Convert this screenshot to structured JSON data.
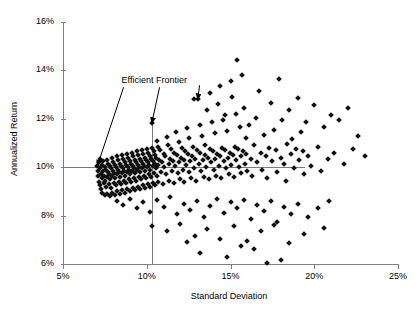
{
  "chart_data": {
    "type": "scatter",
    "title": "",
    "xlabel": "Standard Deviation",
    "ylabel": "Annualized Return",
    "xlim": [
      5,
      25
    ],
    "ylim": [
      6,
      16
    ],
    "xticks": [
      "5%",
      "10%",
      "15%",
      "20%",
      "25%"
    ],
    "xtick_values": [
      5,
      10,
      15,
      20,
      25
    ],
    "yticks": [
      "6%",
      "8%",
      "10%",
      "12%",
      "14%",
      "16%"
    ],
    "ytick_values": [
      6,
      8,
      10,
      12,
      14,
      16
    ],
    "grid": false,
    "legend": "none",
    "marker": "diamond",
    "marker_color": "#111111",
    "annotations": [
      {
        "text": "Efficient Frontier",
        "x_pct": 7.9,
        "y_pct": 13.55,
        "arrows": [
          {
            "to_x": 7.05,
            "to_y": 10.05
          },
          {
            "to_x": 10.3,
            "to_y": 11.82
          },
          {
            "to_x": 13.05,
            "to_y": 12.8
          }
        ]
      }
    ],
    "reference_lines": [
      {
        "orient": "horizontal",
        "value": 10.0,
        "from": 5.0,
        "to": 19.45,
        "color": "#7a7a7a"
      },
      {
        "orient": "vertical",
        "value": 10.3,
        "from": 6.0,
        "to": 11.82,
        "color": "#7a7a7a"
      }
    ],
    "points": [
      [
        7.05,
        10.05
      ],
      [
        7.08,
        9.85
      ],
      [
        7.1,
        9.62
      ],
      [
        7.12,
        10.2
      ],
      [
        7.15,
        9.4
      ],
      [
        7.18,
        9.95
      ],
      [
        7.2,
        9.25
      ],
      [
        7.22,
        10.35
      ],
      [
        7.25,
        9.7
      ],
      [
        7.28,
        9.1
      ],
      [
        7.3,
        10.1
      ],
      [
        7.32,
        9.55
      ],
      [
        7.35,
        8.95
      ],
      [
        7.38,
        9.85
      ],
      [
        7.4,
        10.25
      ],
      [
        7.42,
        9.35
      ],
      [
        7.45,
        9.65
      ],
      [
        7.48,
        8.85
      ],
      [
        7.5,
        10.0
      ],
      [
        7.52,
        9.45
      ],
      [
        7.55,
        9.9
      ],
      [
        7.58,
        9.2
      ],
      [
        7.6,
        10.3
      ],
      [
        7.62,
        9.6
      ],
      [
        7.65,
        8.9
      ],
      [
        7.68,
        9.8
      ],
      [
        7.7,
        10.15
      ],
      [
        7.72,
        9.3
      ],
      [
        7.75,
        9.7
      ],
      [
        7.78,
        8.8
      ],
      [
        7.8,
        10.05
      ],
      [
        7.82,
        9.5
      ],
      [
        7.85,
        9.95
      ],
      [
        7.88,
        9.15
      ],
      [
        7.9,
        10.4
      ],
      [
        7.92,
        9.65
      ],
      [
        7.95,
        8.95
      ],
      [
        7.98,
        9.85
      ],
      [
        8.0,
        10.2
      ],
      [
        8.02,
        9.35
      ],
      [
        8.05,
        9.75
      ],
      [
        8.08,
        8.85
      ],
      [
        8.1,
        10.1
      ],
      [
        8.12,
        9.55
      ],
      [
        8.15,
        10.0
      ],
      [
        8.18,
        9.25
      ],
      [
        8.2,
        10.45
      ],
      [
        8.22,
        9.7
      ],
      [
        8.25,
        9.0
      ],
      [
        8.28,
        9.9
      ],
      [
        8.3,
        10.3
      ],
      [
        8.32,
        9.4
      ],
      [
        8.35,
        9.8
      ],
      [
        8.38,
        8.9
      ],
      [
        8.4,
        10.15
      ],
      [
        8.42,
        9.6
      ],
      [
        8.45,
        10.05
      ],
      [
        8.48,
        9.3
      ],
      [
        8.5,
        10.5
      ],
      [
        8.52,
        9.75
      ],
      [
        8.55,
        9.05
      ],
      [
        8.58,
        9.95
      ],
      [
        8.6,
        10.35
      ],
      [
        8.62,
        9.45
      ],
      [
        8.65,
        9.85
      ],
      [
        8.68,
        8.95
      ],
      [
        8.7,
        10.2
      ],
      [
        8.72,
        9.65
      ],
      [
        8.75,
        10.1
      ],
      [
        8.78,
        9.35
      ],
      [
        8.8,
        10.55
      ],
      [
        8.82,
        9.8
      ],
      [
        8.85,
        9.1
      ],
      [
        8.88,
        10.0
      ],
      [
        8.9,
        10.4
      ],
      [
        8.92,
        9.5
      ],
      [
        8.95,
        9.9
      ],
      [
        8.98,
        9.0
      ],
      [
        9.0,
        10.25
      ],
      [
        9.02,
        9.7
      ],
      [
        9.05,
        10.15
      ],
      [
        9.08,
        9.4
      ],
      [
        9.1,
        10.6
      ],
      [
        9.12,
        9.85
      ],
      [
        9.15,
        9.15
      ],
      [
        9.18,
        10.05
      ],
      [
        9.2,
        10.45
      ],
      [
        9.22,
        9.55
      ],
      [
        9.25,
        9.95
      ],
      [
        9.28,
        9.05
      ],
      [
        9.3,
        10.3
      ],
      [
        9.32,
        9.75
      ],
      [
        9.35,
        10.2
      ],
      [
        9.38,
        9.45
      ],
      [
        9.4,
        10.65
      ],
      [
        9.42,
        9.9
      ],
      [
        9.45,
        9.2
      ],
      [
        9.48,
        10.1
      ],
      [
        9.5,
        10.5
      ],
      [
        9.52,
        9.6
      ],
      [
        9.55,
        10.0
      ],
      [
        9.58,
        9.1
      ],
      [
        9.6,
        10.35
      ],
      [
        9.62,
        9.8
      ],
      [
        9.65,
        10.25
      ],
      [
        9.68,
        9.5
      ],
      [
        9.7,
        10.7
      ],
      [
        9.72,
        9.95
      ],
      [
        9.75,
        9.25
      ],
      [
        9.78,
        10.15
      ],
      [
        9.8,
        10.55
      ],
      [
        9.82,
        9.65
      ],
      [
        9.85,
        10.05
      ],
      [
        9.88,
        9.15
      ],
      [
        9.9,
        10.4
      ],
      [
        9.92,
        9.85
      ],
      [
        9.95,
        10.3
      ],
      [
        9.98,
        9.55
      ],
      [
        10.0,
        10.75
      ],
      [
        10.02,
        10.0
      ],
      [
        10.05,
        9.3
      ],
      [
        10.08,
        10.2
      ],
      [
        10.1,
        10.6
      ],
      [
        10.12,
        9.7
      ],
      [
        10.15,
        10.1
      ],
      [
        10.18,
        9.2
      ],
      [
        10.2,
        10.45
      ],
      [
        10.22,
        9.9
      ],
      [
        10.25,
        10.35
      ],
      [
        10.28,
        9.6
      ],
      [
        10.3,
        11.82
      ],
      [
        10.32,
        10.8
      ],
      [
        10.35,
        10.05
      ],
      [
        10.38,
        9.35
      ],
      [
        10.4,
        10.25
      ],
      [
        10.42,
        10.65
      ],
      [
        10.45,
        9.75
      ],
      [
        10.48,
        10.15
      ],
      [
        10.5,
        9.25
      ],
      [
        10.52,
        10.5
      ],
      [
        10.55,
        9.95
      ],
      [
        10.58,
        10.4
      ],
      [
        10.6,
        9.65
      ],
      [
        10.62,
        11.1
      ],
      [
        10.65,
        10.85
      ],
      [
        10.68,
        10.1
      ],
      [
        10.7,
        9.4
      ],
      [
        10.75,
        10.3
      ],
      [
        10.8,
        10.7
      ],
      [
        10.85,
        9.8
      ],
      [
        10.9,
        10.2
      ],
      [
        10.95,
        9.3
      ],
      [
        11.0,
        10.55
      ],
      [
        11.05,
        10.0
      ],
      [
        11.1,
        10.45
      ],
      [
        11.15,
        9.7
      ],
      [
        11.2,
        11.25
      ],
      [
        11.25,
        10.9
      ],
      [
        11.3,
        10.15
      ],
      [
        11.35,
        9.45
      ],
      [
        11.4,
        10.35
      ],
      [
        11.45,
        10.75
      ],
      [
        11.5,
        9.85
      ],
      [
        11.55,
        10.25
      ],
      [
        11.6,
        9.35
      ],
      [
        11.65,
        10.6
      ],
      [
        11.7,
        10.05
      ],
      [
        11.75,
        11.45
      ],
      [
        11.8,
        10.5
      ],
      [
        11.85,
        9.75
      ],
      [
        11.9,
        11.05
      ],
      [
        11.95,
        10.2
      ],
      [
        12.0,
        9.5
      ],
      [
        12.05,
        10.4
      ],
      [
        12.1,
        10.8
      ],
      [
        12.15,
        9.9
      ],
      [
        12.2,
        10.3
      ],
      [
        12.25,
        9.4
      ],
      [
        12.3,
        10.65
      ],
      [
        12.35,
        10.1
      ],
      [
        12.4,
        11.6
      ],
      [
        12.45,
        10.55
      ],
      [
        12.5,
        9.8
      ],
      [
        12.55,
        11.2
      ],
      [
        12.6,
        10.25
      ],
      [
        12.65,
        9.55
      ],
      [
        12.7,
        10.45
      ],
      [
        12.75,
        10.85
      ],
      [
        12.8,
        9.95
      ],
      [
        12.85,
        12.8
      ],
      [
        12.9,
        10.35
      ],
      [
        12.95,
        9.45
      ],
      [
        13.0,
        10.7
      ],
      [
        13.05,
        12.8
      ],
      [
        13.1,
        10.15
      ],
      [
        13.15,
        11.75
      ],
      [
        13.2,
        10.6
      ],
      [
        13.25,
        9.85
      ],
      [
        13.3,
        11.3
      ],
      [
        13.35,
        10.3
      ],
      [
        13.4,
        9.6
      ],
      [
        13.45,
        10.5
      ],
      [
        13.5,
        10.9
      ],
      [
        13.55,
        10.0
      ],
      [
        13.6,
        12.35
      ],
      [
        13.65,
        10.4
      ],
      [
        13.7,
        9.5
      ],
      [
        13.75,
        10.75
      ],
      [
        13.8,
        13.05
      ],
      [
        13.85,
        10.2
      ],
      [
        13.9,
        11.85
      ],
      [
        13.95,
        10.65
      ],
      [
        14.0,
        9.9
      ],
      [
        14.05,
        11.4
      ],
      [
        14.1,
        10.35
      ],
      [
        14.15,
        9.65
      ],
      [
        14.2,
        10.55
      ],
      [
        14.25,
        12.6
      ],
      [
        14.3,
        10.05
      ],
      [
        14.35,
        13.35
      ],
      [
        14.4,
        10.45
      ],
      [
        14.45,
        9.55
      ],
      [
        14.5,
        10.8
      ],
      [
        14.55,
        11.95
      ],
      [
        14.6,
        10.25
      ],
      [
        14.65,
        12.15
      ],
      [
        14.7,
        10.7
      ],
      [
        14.75,
        9.95
      ],
      [
        14.8,
        11.5
      ],
      [
        14.85,
        10.4
      ],
      [
        14.9,
        9.7
      ],
      [
        14.95,
        10.6
      ],
      [
        15.0,
        13.55
      ],
      [
        15.05,
        10.1
      ],
      [
        15.1,
        12.9
      ],
      [
        15.15,
        10.5
      ],
      [
        15.2,
        9.6
      ],
      [
        15.25,
        10.85
      ],
      [
        15.3,
        12.2
      ],
      [
        15.35,
        10.3
      ],
      [
        15.4,
        14.45
      ],
      [
        15.45,
        10.75
      ],
      [
        15.5,
        10.0
      ],
      [
        15.55,
        11.65
      ],
      [
        15.6,
        10.45
      ],
      [
        15.65,
        9.75
      ],
      [
        15.7,
        13.8
      ],
      [
        15.75,
        10.65
      ],
      [
        15.8,
        12.45
      ],
      [
        15.85,
        10.15
      ],
      [
        15.9,
        11.2
      ],
      [
        15.95,
        10.55
      ],
      [
        16.0,
        9.85
      ],
      [
        16.1,
        11.75
      ],
      [
        16.2,
        10.35
      ],
      [
        16.3,
        9.65
      ],
      [
        16.4,
        10.9
      ],
      [
        16.5,
        12.05
      ],
      [
        16.6,
        10.2
      ],
      [
        16.7,
        13.15
      ],
      [
        16.8,
        10.6
      ],
      [
        16.9,
        9.9
      ],
      [
        17.0,
        11.35
      ],
      [
        17.1,
        10.45
      ],
      [
        17.2,
        9.55
      ],
      [
        17.3,
        10.8
      ],
      [
        17.4,
        12.65
      ],
      [
        17.5,
        10.25
      ],
      [
        17.6,
        11.55
      ],
      [
        17.7,
        10.7
      ],
      [
        17.8,
        9.8
      ],
      [
        17.9,
        13.65
      ],
      [
        18.0,
        10.4
      ],
      [
        18.1,
        11.95
      ],
      [
        18.2,
        10.15
      ],
      [
        18.3,
        9.45
      ],
      [
        18.4,
        10.95
      ],
      [
        18.5,
        12.35
      ],
      [
        18.6,
        10.55
      ],
      [
        18.7,
        11.15
      ],
      [
        18.8,
        9.95
      ],
      [
        18.9,
        10.75
      ],
      [
        19.0,
        12.85
      ],
      [
        19.1,
        10.3
      ],
      [
        19.2,
        11.45
      ],
      [
        19.3,
        10.65
      ],
      [
        19.4,
        9.7
      ],
      [
        19.5,
        11.85
      ],
      [
        19.6,
        10.45
      ],
      [
        19.8,
        10.05
      ],
      [
        20.0,
        12.55
      ],
      [
        20.2,
        10.85
      ],
      [
        20.4,
        9.85
      ],
      [
        20.6,
        11.65
      ],
      [
        20.8,
        10.35
      ],
      [
        21.0,
        12.15
      ],
      [
        21.2,
        10.6
      ],
      [
        21.5,
        11.95
      ],
      [
        21.8,
        10.15
      ],
      [
        22.0,
        12.45
      ],
      [
        22.3,
        10.75
      ],
      [
        22.6,
        11.3
      ],
      [
        23.0,
        10.45
      ],
      [
        8.2,
        8.6
      ],
      [
        8.6,
        8.45
      ],
      [
        9.0,
        8.7
      ],
      [
        9.4,
        8.3
      ],
      [
        9.8,
        8.55
      ],
      [
        10.2,
        8.15
      ],
      [
        10.6,
        8.65
      ],
      [
        11.0,
        8.35
      ],
      [
        11.4,
        8.75
      ],
      [
        11.8,
        8.05
      ],
      [
        12.2,
        8.5
      ],
      [
        12.6,
        8.25
      ],
      [
        13.0,
        8.6
      ],
      [
        13.4,
        7.95
      ],
      [
        13.8,
        8.4
      ],
      [
        14.2,
        8.7
      ],
      [
        14.6,
        8.1
      ],
      [
        15.0,
        8.55
      ],
      [
        15.4,
        8.3
      ],
      [
        15.8,
        8.65
      ],
      [
        16.2,
        7.85
      ],
      [
        16.6,
        8.45
      ],
      [
        17.0,
        8.2
      ],
      [
        17.4,
        8.6
      ],
      [
        17.8,
        7.75
      ],
      [
        18.2,
        8.35
      ],
      [
        18.6,
        8.05
      ],
      [
        19.0,
        8.5
      ],
      [
        19.6,
        7.95
      ],
      [
        20.2,
        8.3
      ],
      [
        20.9,
        8.6
      ],
      [
        10.3,
        7.55
      ],
      [
        11.2,
        7.35
      ],
      [
        12.0,
        7.65
      ],
      [
        12.9,
        7.15
      ],
      [
        13.6,
        7.45
      ],
      [
        14.4,
        7.05
      ],
      [
        15.2,
        7.55
      ],
      [
        16.0,
        6.95
      ],
      [
        16.8,
        7.35
      ],
      [
        17.6,
        7.6
      ],
      [
        18.5,
        6.85
      ],
      [
        19.4,
        7.25
      ],
      [
        20.6,
        7.5
      ],
      [
        13.2,
        6.45
      ],
      [
        14.8,
        6.3
      ],
      [
        16.4,
        6.6
      ],
      [
        18.0,
        6.15
      ],
      [
        15.6,
        6.75
      ],
      [
        17.2,
        6.05
      ],
      [
        12.4,
        6.9
      ]
    ]
  }
}
